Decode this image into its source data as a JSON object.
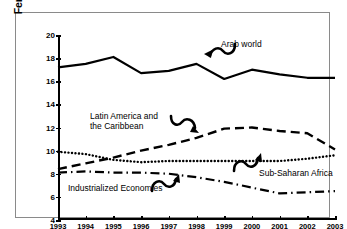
{
  "chart_data": {
    "type": "line",
    "title": "",
    "xlabel": "",
    "ylabel": "Female Unemployment Rate (%)",
    "x": [
      1993,
      1994,
      1995,
      1996,
      1997,
      1998,
      1999,
      2000,
      2001,
      2002,
      2003
    ],
    "xtick_labels": [
      "1993",
      "1994",
      "1995",
      "1996",
      "1997",
      "1998",
      "1999",
      "2000",
      "2001",
      "2002",
      "2003"
    ],
    "ytick_labels": [
      "4",
      "6",
      "8",
      "10",
      "12",
      "14",
      "16",
      "18",
      "20"
    ],
    "ytick_values": [
      4,
      6,
      8,
      10,
      12,
      14,
      16,
      18,
      20
    ],
    "xlim": [
      1993,
      2003
    ],
    "ylim": [
      4,
      20
    ],
    "grid": false,
    "legend_position": "inline-annotations",
    "series": [
      {
        "name": "Arab world",
        "linestyle": "solid",
        "color": "#000000",
        "values": [
          17.2,
          17.5,
          18.1,
          16.7,
          16.9,
          17.5,
          16.2,
          17.0,
          16.6,
          16.3,
          16.3
        ]
      },
      {
        "name": "Latin America and the Caribbean",
        "linestyle": "dashed",
        "color": "#000000",
        "values": [
          8.4,
          8.9,
          9.4,
          10.0,
          10.5,
          11.1,
          11.9,
          12.0,
          11.7,
          11.5,
          10.1
        ]
      },
      {
        "name": "Sub-Saharan Africa",
        "linestyle": "dotted",
        "color": "#000000",
        "values": [
          9.9,
          9.7,
          9.2,
          9.0,
          9.1,
          9.1,
          9.1,
          9.1,
          9.1,
          9.3,
          9.6
        ]
      },
      {
        "name": "Industrialized Economies",
        "linestyle": "dashdot",
        "color": "#000000",
        "values": [
          8.1,
          8.2,
          8.1,
          8.1,
          8.0,
          7.7,
          7.3,
          6.8,
          6.3,
          6.4,
          6.5
        ]
      }
    ],
    "annotations": [
      {
        "text": "Arab world",
        "series": "Arab world"
      },
      {
        "text": "Latin America and\nthe Caribbean",
        "series": "Latin America and the Caribbean"
      },
      {
        "text": "Industrialized Economies",
        "series": "Industrialized Economies"
      },
      {
        "text": "Sub-Saharan Africa",
        "series": "Sub-Saharan Africa"
      }
    ]
  },
  "labels": {
    "y_axis_title": "Female Unemployment Rate (%)",
    "arab_world": "Arab world",
    "latin_america_line1": "Latin America and",
    "latin_america_line2": "the Caribbean",
    "industrialized": "Industrialized Economies",
    "subsaharan": "Sub-Saharan Africa"
  }
}
